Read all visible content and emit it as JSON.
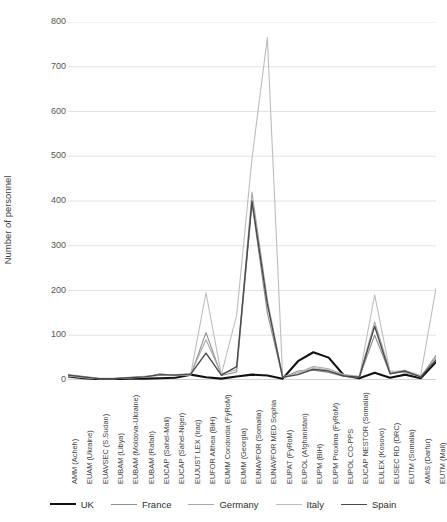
{
  "chart_data": {
    "type": "line",
    "title": "",
    "xlabel": "",
    "ylabel": "Number of personnel",
    "ylim": [
      0,
      800
    ],
    "yticks": [
      0,
      100,
      200,
      300,
      400,
      500,
      600,
      700,
      800
    ],
    "grid": true,
    "legend_position": "bottom",
    "categories": [
      "AMM (Acheh)",
      "EUAM (Ukraine)",
      "EUAVSEC (S.Sudan)",
      "EUBAM (Libya)",
      "EUBAM (Moldova-Ukraine)",
      "EUBAM (Rafah)",
      "EUCAP (Sahel-Mali)",
      "EUCAP (Sahel-Niger)",
      "EUJUST LEX (Iraq)",
      "EUFOR Althea (BiH)",
      "EUMM Condordia (FyRoM)",
      "EUMM (Georgia)",
      "EUNAVFOR (Somalia)",
      "EUNAVFOR MED Sophia",
      "EUPAT (FyRoM)",
      "EUPOL (Afghanistan)",
      "EUPM (BiH)",
      "EUPM Proxima (FyRoM)",
      "EUPOL CO-PPS",
      "EUCAP NESTOR (Somalia)",
      "EULEX (Kosovo)",
      "EUSEC RD (DRC)",
      "EUTM (Somalia)",
      "AMIS (Darfur)",
      "EUTM (Mali)"
    ],
    "series": [
      {
        "name": "UK",
        "color": "#111111",
        "width": 2.1,
        "values": [
          8,
          4,
          2,
          2,
          3,
          3,
          4,
          5,
          12,
          6,
          3,
          8,
          12,
          10,
          3,
          42,
          62,
          50,
          10,
          4,
          16,
          5,
          12,
          4,
          40
        ]
      },
      {
        "name": "France",
        "color": "#8f8f8f",
        "width": 1.1,
        "values": [
          10,
          6,
          3,
          3,
          4,
          6,
          14,
          10,
          10,
          106,
          10,
          18,
          395,
          150,
          5,
          20,
          22,
          17,
          8,
          6,
          100,
          15,
          18,
          6,
          55
        ]
      },
      {
        "name": "Germany",
        "color": "#a8a8a8",
        "width": 1.1,
        "values": [
          12,
          8,
          4,
          4,
          6,
          8,
          10,
          12,
          14,
          90,
          14,
          23,
          420,
          180,
          6,
          16,
          30,
          25,
          12,
          8,
          130,
          20,
          16,
          8,
          50
        ]
      },
      {
        "name": "Italy",
        "color": "#bdbdbd",
        "width": 1.1,
        "values": [
          9,
          5,
          3,
          3,
          5,
          7,
          11,
          9,
          12,
          195,
          12,
          145,
          495,
          765,
          8,
          14,
          28,
          22,
          10,
          7,
          190,
          18,
          22,
          10,
          205
        ]
      },
      {
        "name": "Spain",
        "color": "#4a4a4a",
        "width": 1.4,
        "values": [
          11,
          7,
          3,
          3,
          5,
          7,
          12,
          11,
          13,
          60,
          11,
          30,
          400,
          170,
          6,
          12,
          24,
          20,
          9,
          6,
          120,
          14,
          20,
          7,
          45
        ]
      }
    ]
  },
  "legend": {
    "items": [
      {
        "label": "UK"
      },
      {
        "label": "France"
      },
      {
        "label": "Germany"
      },
      {
        "label": "Italy"
      },
      {
        "label": "Spain"
      }
    ]
  }
}
